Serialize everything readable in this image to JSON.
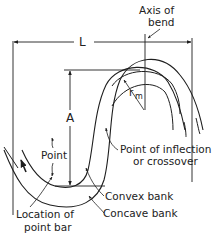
{
  "diagram": {
    "type": "meander-bend-geometry",
    "colors": {
      "line": "#1e1e1e",
      "text": "#222222",
      "background": "#ffffff"
    },
    "labels": {
      "axis_line1": "Axis of",
      "axis_line2": "bend",
      "wavelength": "L",
      "amplitude": "A",
      "radius_r": "r",
      "radius_sub": "m",
      "point": "Point",
      "inflection_line1": "Point of inflection",
      "inflection_line2": "or crossover",
      "convex": "Convex bank",
      "concave": "Concave bank",
      "pointbar_line1": "Location of",
      "pointbar_line2": "point bar"
    },
    "icons": {
      "flow_direction": "arrow-up-icon"
    }
  }
}
